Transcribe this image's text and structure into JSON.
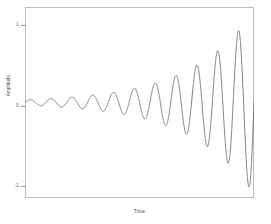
{
  "figure": {
    "background_color": "#ffffff",
    "frame_color": "#bdbdbd",
    "line_color": "#555555"
  },
  "axes": {
    "y_title": "Amplitude",
    "x_title": "Time",
    "y_tick_labels": [
      "1",
      "0",
      "-1"
    ],
    "y_tick_values": [
      1,
      0,
      -1
    ],
    "x_tick_labels": []
  },
  "chart_data": {
    "type": "line",
    "title": "",
    "subtitle": "",
    "xlabel": "Time",
    "ylabel": "Amplitude",
    "xlim": [
      0,
      11
    ],
    "ylim": [
      -1.12,
      1.12
    ],
    "grid": false,
    "legend": null,
    "series": [
      {
        "name": "signal",
        "color": "#555555",
        "envelope_model": "A(t) = 0.030 * exp(0.325 * t)",
        "frequency_cycles": 11,
        "x": [
          0.0,
          0.5,
          1.0,
          1.5,
          2.0,
          2.5,
          3.0,
          3.5,
          4.0,
          4.5,
          5.0,
          5.5,
          6.0,
          6.5,
          7.0,
          7.5,
          8.0,
          8.5,
          9.0,
          9.5,
          10.0,
          10.5,
          11.0
        ],
        "envelope_values": [
          0.03,
          0.035,
          0.042,
          0.049,
          0.058,
          0.068,
          0.079,
          0.093,
          0.11,
          0.129,
          0.152,
          0.179,
          0.21,
          0.247,
          0.291,
          0.342,
          0.402,
          0.473,
          0.556,
          0.654,
          0.769,
          0.905,
          1.0
        ],
        "peaks": [
          {
            "x": 0.25,
            "y": 0.05
          },
          {
            "x": 1.25,
            "y": 0.09
          },
          {
            "x": 2.25,
            "y": 0.13
          },
          {
            "x": 3.25,
            "y": 0.19
          },
          {
            "x": 4.25,
            "y": 0.27
          },
          {
            "x": 5.25,
            "y": 0.37
          },
          {
            "x": 6.25,
            "y": 0.49
          },
          {
            "x": 7.25,
            "y": 0.62
          },
          {
            "x": 8.25,
            "y": 0.72
          },
          {
            "x": 9.25,
            "y": 0.81
          },
          {
            "x": 10.25,
            "y": 0.95
          }
        ],
        "troughs": [
          {
            "x": 0.75,
            "y": -0.07
          },
          {
            "x": 1.75,
            "y": -0.11
          },
          {
            "x": 2.75,
            "y": -0.16
          },
          {
            "x": 3.75,
            "y": -0.23
          },
          {
            "x": 4.75,
            "y": -0.32
          },
          {
            "x": 5.75,
            "y": -0.43
          },
          {
            "x": 6.75,
            "y": -0.56
          },
          {
            "x": 7.75,
            "y": -0.67
          },
          {
            "x": 8.75,
            "y": -0.78
          },
          {
            "x": 9.75,
            "y": -0.89
          },
          {
            "x": 10.75,
            "y": -1.0
          }
        ]
      }
    ]
  }
}
